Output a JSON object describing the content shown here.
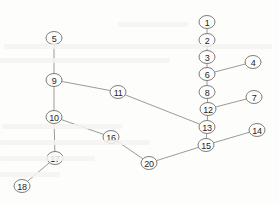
{
  "figure": {
    "type": "node-link-diagram",
    "background_color": "#fdfdfc",
    "node_stroke_color": "#6e6e6b",
    "edge_stroke_color": "#8f8f8c",
    "label_color": "#1d1d1c",
    "node_radius_x": 8,
    "node_radius_y": 6.5,
    "width": 279,
    "height": 205
  },
  "chart_data": {
    "type": "graph",
    "title": "",
    "xlabel": "",
    "ylabel": "",
    "grid": false,
    "legend": "none",
    "xlim": [
      0,
      279
    ],
    "ylim": [
      0,
      205
    ],
    "nodes": [
      {
        "id": "1",
        "label": "1",
        "x": 207,
        "y": 22
      },
      {
        "id": "2",
        "label": "2",
        "x": 207,
        "y": 40
      },
      {
        "id": "3",
        "label": "3",
        "x": 207,
        "y": 57
      },
      {
        "id": "4",
        "label": "4",
        "x": 253,
        "y": 62
      },
      {
        "id": "5",
        "label": "5",
        "x": 54,
        "y": 38
      },
      {
        "id": "6",
        "label": "6",
        "x": 207,
        "y": 74
      },
      {
        "id": "7",
        "label": "7",
        "x": 254,
        "y": 97
      },
      {
        "id": "8",
        "label": "8",
        "x": 207,
        "y": 92
      },
      {
        "id": "9",
        "label": "9",
        "x": 54,
        "y": 80
      },
      {
        "id": "10",
        "label": "10",
        "x": 54,
        "y": 117
      },
      {
        "id": "11",
        "label": "11",
        "x": 118,
        "y": 92
      },
      {
        "id": "12",
        "label": "12",
        "x": 208,
        "y": 109
      },
      {
        "id": "13",
        "label": "13",
        "x": 207,
        "y": 127
      },
      {
        "id": "14",
        "label": "14",
        "x": 257,
        "y": 130
      },
      {
        "id": "15",
        "label": "15",
        "x": 206,
        "y": 145
      },
      {
        "id": "16",
        "label": "16",
        "x": 111,
        "y": 137
      },
      {
        "id": "17",
        "label": "17",
        "x": 55,
        "y": 158
      },
      {
        "id": "18",
        "label": "18",
        "x": 22,
        "y": 186
      },
      {
        "id": "20",
        "label": "20",
        "x": 149,
        "y": 163
      }
    ],
    "edges": [
      {
        "source": "1",
        "target": "2"
      },
      {
        "source": "2",
        "target": "3"
      },
      {
        "source": "3",
        "target": "6"
      },
      {
        "source": "6",
        "target": "4"
      },
      {
        "source": "6",
        "target": "8"
      },
      {
        "source": "8",
        "target": "12"
      },
      {
        "source": "12",
        "target": "7"
      },
      {
        "source": "12",
        "target": "13"
      },
      {
        "source": "13",
        "target": "11"
      },
      {
        "source": "13",
        "target": "15"
      },
      {
        "source": "15",
        "target": "14"
      },
      {
        "source": "15",
        "target": "20"
      },
      {
        "source": "20",
        "target": "16"
      },
      {
        "source": "16",
        "target": "10"
      },
      {
        "source": "5",
        "target": "9"
      },
      {
        "source": "9",
        "target": "10"
      },
      {
        "source": "9",
        "target": "11"
      },
      {
        "source": "10",
        "target": "17"
      },
      {
        "source": "17",
        "target": "18"
      }
    ]
  }
}
